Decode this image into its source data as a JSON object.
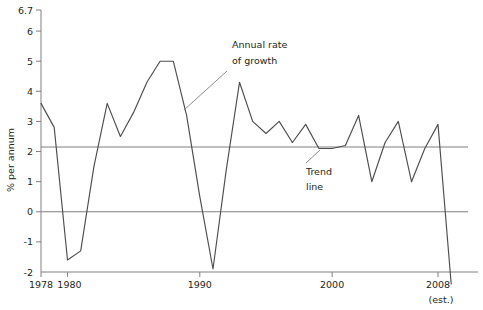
{
  "chart_data": {
    "type": "line",
    "title": "",
    "xlabel": "",
    "ylabel": "% per annum",
    "xlim": [
      1978,
      2009
    ],
    "ylim": [
      -2,
      6.7
    ],
    "grid": false,
    "legend": "none",
    "x_ticks": [
      "1978",
      "1980",
      "1990",
      "2000",
      "2008"
    ],
    "x_tick_values": [
      1978,
      1980,
      1990,
      2000,
      2008
    ],
    "x_tick_sublabel": "(est.)",
    "y_ticks": [
      "6.7",
      "6",
      "5",
      "4",
      "3",
      "2",
      "1",
      "0",
      "-1",
      "-2"
    ],
    "y_tick_values": [
      6.7,
      6,
      5,
      4,
      3,
      2,
      1,
      0,
      -1,
      -2
    ],
    "series": [
      {
        "name": "Annual rate of growth",
        "color": "#4d4d4d",
        "x": [
          1978,
          1979,
          1980,
          1981,
          1982,
          1983,
          1984,
          1985,
          1986,
          1987,
          1988,
          1989,
          1990,
          1991,
          1992,
          1993,
          1994,
          1995,
          1996,
          1997,
          1998,
          1999,
          2000,
          2001,
          2002,
          2003,
          2004,
          2005,
          2006,
          2007,
          2008,
          2009
        ],
        "values": [
          3.6,
          2.8,
          -1.6,
          -1.3,
          1.5,
          3.6,
          2.5,
          3.3,
          4.3,
          5.0,
          5.0,
          3.2,
          0.5,
          -1.9,
          1.4,
          4.3,
          3.0,
          2.6,
          3.0,
          2.3,
          2.9,
          2.1,
          2.1,
          2.2,
          3.2,
          1.0,
          2.3,
          3.0,
          1.0,
          2.1,
          2.9,
          -2.4
        ]
      }
    ],
    "trend_line": {
      "name": "Trend line",
      "value": 2.15,
      "color": "#808080"
    },
    "zero_line": {
      "name": "Zero line",
      "value": 0,
      "color": "#808080"
    },
    "annotations": [
      {
        "name": "annual-rate-of-growth",
        "line1": "Annual rate",
        "line2": "of growth"
      },
      {
        "name": "trend-line",
        "line1": "Trend",
        "line2": "line"
      }
    ]
  }
}
